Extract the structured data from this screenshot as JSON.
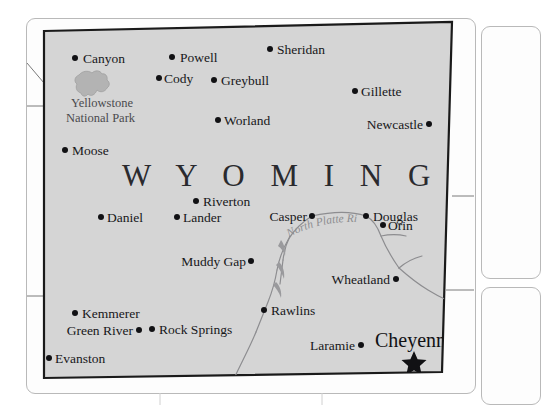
{
  "map": {
    "title": "Wyoming",
    "state_label": "W Y O M I N G",
    "capital_marker": "star",
    "background_color": "#d5d5d5",
    "border_color": "#1a1a1a",
    "page_color": "#fdfdfd",
    "river_color": "#8d8d90",
    "park_color": "#b3b3b3",
    "park": {
      "name_line1": "Yellowstone",
      "name_line2": "National Park",
      "icon": "park-shape-icon"
    },
    "river": {
      "name": "North Platte River"
    },
    "cities": [
      {
        "name": "Canyon",
        "dot_x": 75,
        "dot_y": 58,
        "label_x": 83,
        "label_y": 63,
        "anchor": "start",
        "capital": false
      },
      {
        "name": "Powell",
        "dot_x": 172,
        "dot_y": 57,
        "label_x": 180,
        "label_y": 62,
        "anchor": "start",
        "capital": false
      },
      {
        "name": "Sheridan",
        "dot_x": 270,
        "dot_y": 49,
        "label_x": 277,
        "label_y": 54,
        "anchor": "start",
        "capital": false
      },
      {
        "name": "Cody",
        "dot_x": 159,
        "dot_y": 78,
        "label_x": 164,
        "label_y": 83,
        "anchor": "start",
        "capital": false
      },
      {
        "name": "Greybull",
        "dot_x": 214,
        "dot_y": 80,
        "label_x": 221,
        "label_y": 85,
        "anchor": "start",
        "capital": false
      },
      {
        "name": "Gillette",
        "dot_x": 355,
        "dot_y": 91,
        "label_x": 361,
        "label_y": 96,
        "anchor": "start",
        "capital": false
      },
      {
        "name": "Worland",
        "dot_x": 218,
        "dot_y": 120,
        "label_x": 224,
        "label_y": 125,
        "anchor": "start",
        "capital": false
      },
      {
        "name": "Newcastle",
        "dot_x": 429,
        "dot_y": 124,
        "label_x": 423,
        "label_y": 129,
        "anchor": "end",
        "capital": false
      },
      {
        "name": "Moose",
        "dot_x": 65,
        "dot_y": 150,
        "label_x": 72,
        "label_y": 155,
        "anchor": "start",
        "capital": false
      },
      {
        "name": "Riverton",
        "dot_x": 196,
        "dot_y": 201,
        "label_x": 203,
        "label_y": 206,
        "anchor": "start",
        "capital": false
      },
      {
        "name": "Daniel",
        "dot_x": 101,
        "dot_y": 217,
        "label_x": 107,
        "label_y": 222,
        "anchor": "start",
        "capital": false
      },
      {
        "name": "Lander",
        "dot_x": 177,
        "dot_y": 217,
        "label_x": 183,
        "label_y": 222,
        "anchor": "start",
        "capital": false
      },
      {
        "name": "Casper",
        "dot_x": 312,
        "dot_y": 216,
        "label_x": 307,
        "label_y": 221,
        "anchor": "end",
        "capital": false
      },
      {
        "name": "Douglas",
        "dot_x": 366,
        "dot_y": 216,
        "label_x": 373,
        "label_y": 221,
        "anchor": "start",
        "capital": false
      },
      {
        "name": "Orin",
        "dot_x": 383,
        "dot_y": 225,
        "label_x": 388,
        "label_y": 230,
        "anchor": "start",
        "capital": false
      },
      {
        "name": "Muddy Gap",
        "dot_x": 251,
        "dot_y": 261,
        "label_x": 246,
        "label_y": 266,
        "anchor": "end",
        "capital": false
      },
      {
        "name": "Wheatland",
        "dot_x": 396,
        "dot_y": 279,
        "label_x": 390,
        "label_y": 284,
        "anchor": "end",
        "capital": false
      },
      {
        "name": "Kemmerer",
        "dot_x": 75,
        "dot_y": 313,
        "label_x": 82,
        "label_y": 318,
        "anchor": "start",
        "capital": false
      },
      {
        "name": "Rawlins",
        "dot_x": 264,
        "dot_y": 310,
        "label_x": 271,
        "label_y": 315,
        "anchor": "start",
        "capital": false
      },
      {
        "name": "Green River",
        "dot_x": 139,
        "dot_y": 330,
        "label_x": 133,
        "label_y": 335,
        "anchor": "end",
        "capital": false
      },
      {
        "name": "Rock Springs",
        "dot_x": 152,
        "dot_y": 329,
        "label_x": 159,
        "label_y": 334,
        "anchor": "start",
        "capital": false
      },
      {
        "name": "Laramie",
        "dot_x": 361,
        "dot_y": 345,
        "label_x": 355,
        "label_y": 350,
        "anchor": "end",
        "capital": false
      },
      {
        "name": "Cheyenne",
        "dot_x": 414,
        "dot_y": 358,
        "label_x": 375,
        "label_y": 347,
        "anchor": "start",
        "capital": true
      },
      {
        "name": "Evanston",
        "dot_x": 49,
        "dot_y": 358,
        "label_x": 55,
        "label_y": 363,
        "anchor": "start",
        "capital": false
      }
    ]
  }
}
